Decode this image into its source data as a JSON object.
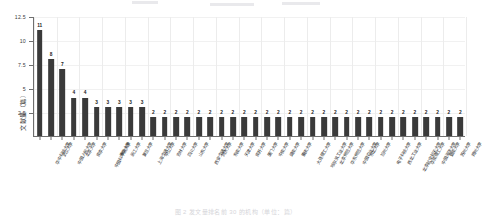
{
  "figure": {
    "caption": "图 2 发文量排名前 30 的机构（单位：篇）",
    "top_fragments": [
      {
        "left": 0,
        "top": 0,
        "width": 26
      },
      {
        "left": 78,
        "top": 2,
        "width": 44
      },
      {
        "left": 150,
        "top": 1,
        "width": 38
      }
    ]
  },
  "chart_data": {
    "type": "bar",
    "title": "",
    "xlabel": "",
    "ylabel": "文献量（篇）",
    "ylim": [
      0,
      12.5
    ],
    "yticks": [
      "12.5",
      "10",
      "7.5",
      "5",
      "2.5"
    ],
    "ytick_values": [
      12.5,
      10,
      7.5,
      5,
      2.5
    ],
    "grid": true,
    "legend": "none",
    "bar_color": "#3a3a3a",
    "show_data_labels": true,
    "categories": [
      "华中科技大学",
      "武汉大学",
      "中国人民大学",
      "北京大学",
      "南京大学",
      "中国科学院大学",
      "清华大学",
      "浙江大学",
      "复旦大学",
      "上海交通大学",
      "中山大学",
      "吉林大学",
      "四川大学",
      "山东大学",
      "西安交通大学",
      "同济大学",
      "东南大学",
      "天津大学",
      "南开大学",
      "厦门大学",
      "中南大学",
      "湖南大学",
      "重庆大学",
      "大连理工大学",
      "哈尔滨工业大学",
      "北京师范大学",
      "华东师范大学",
      "中国农业大学",
      "东北大学",
      "兰州大学",
      "电子科技大学",
      "西北工业大学",
      "北京航空航天大学",
      "华南理工大学",
      "中国海洋大学",
      "暨南大学",
      "苏州大学",
      "郑州大学"
    ],
    "values": [
      11,
      8,
      7,
      4,
      4,
      3,
      3,
      3,
      3,
      3,
      2,
      2,
      2,
      2,
      2,
      2,
      2,
      2,
      2,
      2,
      2,
      2,
      2,
      2,
      2,
      2,
      2,
      2,
      2,
      2,
      2,
      2,
      2,
      2,
      2,
      2,
      2,
      2
    ]
  }
}
